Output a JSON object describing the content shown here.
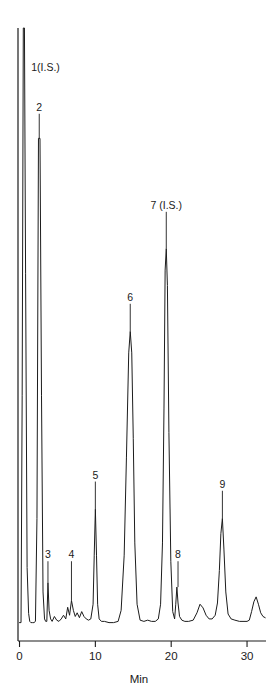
{
  "figure": {
    "title": "",
    "background_color": "#ffffff",
    "trace_color": "#1c1c1c",
    "axis_color": "#1c1c1c"
  },
  "chart_data": {
    "type": "line",
    "title": "",
    "subtitle": "",
    "xlabel": "Min",
    "ylabel": "",
    "xlim": [
      -0.2,
      32.5
    ],
    "ylim": [
      0,
      100
    ],
    "grid": false,
    "legend_position": "none",
    "xticks": [
      0,
      10,
      20,
      30
    ],
    "xtick_labels": [
      "0",
      "10",
      "20",
      "30"
    ],
    "yticks": [],
    "ytick_labels": [],
    "series": [
      {
        "name": "chromatogram",
        "color": "#1c1c1c",
        "x": [
          0.0,
          0.2,
          0.35,
          0.5,
          0.65,
          0.8,
          1.0,
          1.2,
          1.35,
          1.5,
          1.7,
          1.9,
          2.1,
          2.3,
          2.5,
          2.7,
          2.9,
          3.1,
          3.3,
          3.45,
          3.6,
          3.75,
          3.9,
          4.1,
          4.3,
          4.6,
          4.9,
          5.2,
          5.5,
          5.8,
          6.1,
          6.35,
          6.6,
          6.85,
          7.1,
          7.35,
          7.6,
          7.9,
          8.2,
          8.5,
          8.8,
          9.1,
          9.4,
          9.7,
          9.85,
          10.0,
          10.15,
          10.3,
          10.5,
          10.8,
          11.2,
          11.8,
          12.4,
          13.0,
          13.4,
          13.8,
          14.1,
          14.4,
          14.6,
          14.8,
          15.0,
          15.2,
          15.5,
          15.9,
          16.4,
          16.9,
          17.4,
          17.9,
          18.3,
          18.6,
          18.85,
          19.05,
          19.2,
          19.35,
          19.5,
          19.7,
          19.95,
          20.2,
          20.45,
          20.6,
          20.75,
          20.9,
          21.1,
          21.4,
          21.8,
          22.3,
          22.9,
          23.4,
          23.8,
          24.2,
          24.6,
          25.0,
          25.4,
          25.8,
          26.1,
          26.35,
          26.55,
          26.75,
          26.95,
          27.2,
          27.5,
          27.9,
          28.4,
          29.0,
          29.6,
          30.0,
          30.3,
          30.6,
          30.9,
          31.2,
          31.5,
          31.8,
          32.1,
          32.4
        ],
        "y": [
          3.0,
          3.0,
          40.0,
          100.0,
          100.0,
          60.0,
          12.0,
          4.5,
          3.2,
          3.0,
          3.0,
          3.0,
          3.2,
          20.0,
          82.0,
          82.0,
          40.0,
          8.0,
          3.6,
          3.2,
          3.2,
          9.5,
          5.0,
          3.6,
          3.2,
          4.0,
          3.4,
          3.2,
          3.6,
          4.2,
          3.6,
          5.5,
          4.2,
          6.6,
          5.0,
          4.0,
          4.6,
          3.8,
          4.8,
          4.0,
          3.6,
          3.4,
          3.6,
          6.0,
          14.0,
          21.5,
          14.0,
          6.0,
          3.6,
          3.2,
          3.2,
          3.0,
          3.0,
          3.2,
          5.0,
          14.0,
          30.0,
          47.0,
          50.5,
          47.0,
          33.0,
          16.0,
          6.0,
          3.4,
          3.2,
          3.4,
          3.2,
          3.2,
          3.6,
          6.0,
          16.0,
          38.0,
          60.5,
          64.0,
          58.0,
          34.0,
          13.0,
          4.8,
          3.6,
          6.0,
          8.8,
          6.2,
          4.0,
          3.4,
          3.2,
          3.2,
          3.4,
          4.6,
          6.0,
          5.4,
          4.2,
          3.6,
          3.6,
          4.2,
          6.2,
          11.5,
          17.5,
          20.0,
          15.0,
          8.0,
          4.4,
          3.6,
          3.4,
          3.2,
          3.2,
          3.2,
          3.4,
          4.8,
          6.4,
          7.2,
          6.0,
          4.6,
          4.0,
          3.8
        ]
      }
    ],
    "annotations": [
      {
        "id": "peak-1",
        "label": "1(I.S.)",
        "x": 0.5,
        "y": 100.0,
        "label_x": 1.55,
        "label_y": 93.0,
        "align": "left"
      },
      {
        "id": "peak-2",
        "label": "2",
        "x": 2.6,
        "y": 82.0,
        "label_x": 2.75,
        "label_y": 86.5,
        "align": "center"
      },
      {
        "id": "peak-3",
        "label": "3",
        "x": 3.75,
        "y": 9.5,
        "label_x": 3.75,
        "label_y": 13.5,
        "align": "center"
      },
      {
        "id": "peak-4",
        "label": "4",
        "x": 6.85,
        "y": 6.6,
        "label_x": 6.85,
        "label_y": 13.5,
        "align": "center"
      },
      {
        "id": "peak-5",
        "label": "5",
        "x": 10.0,
        "y": 21.5,
        "label_x": 10.0,
        "label_y": 26.5,
        "align": "center"
      },
      {
        "id": "peak-6",
        "label": "6",
        "x": 14.6,
        "y": 50.5,
        "label_x": 14.6,
        "label_y": 55.5,
        "align": "center"
      },
      {
        "id": "peak-7",
        "label": "7 (I.S.)",
        "x": 19.35,
        "y": 64.0,
        "label_x": 19.9,
        "label_y": 70.5,
        "align": "center"
      },
      {
        "id": "peak-8",
        "label": "8",
        "x": 20.9,
        "y": 8.8,
        "label_x": 20.9,
        "label_y": 13.5,
        "align": "center"
      },
      {
        "id": "peak-9",
        "label": "9",
        "x": 26.75,
        "y": 20.0,
        "label_x": 26.75,
        "label_y": 25.0,
        "align": "center"
      }
    ]
  }
}
